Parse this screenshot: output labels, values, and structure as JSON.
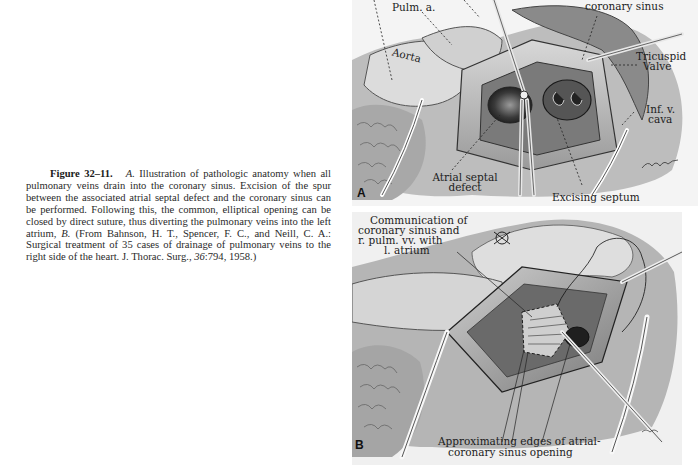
{
  "caption": {
    "figure_label": "Figure 32–11.",
    "panel_a_ref": "A.",
    "text_1": "Illustration of pathologic anatomy when all pulmonary veins drain into the coronary sinus. Excision of the spur between the associated atrial septal defect and the coronary sinus can be performed. Following this, the common, elliptical opening can be closed by direct suture, thus diverting the pulmonary veins into the left atrium,",
    "panel_b_ref": "B.",
    "text_2": "(From Bahnson, H. T., Spencer, F. C., and Neill, C. A.: Surgical treatment of 35 cases of drainage of pulmonary veins to the right side of the heart. J. Thorac. Surg.,",
    "volume": "36",
    "pages": ":794, 1958.)"
  },
  "panel_a": {
    "letter": "A",
    "labels": {
      "pulm_a": "Pulm. a.",
      "coronary_sinus": "coronary sinus",
      "aorta": "Aorta",
      "tricuspid_1": "Tricuspid",
      "tricuspid_2": "Valve",
      "ivc_1": "Inf. v.",
      "ivc_2": "cava",
      "asd_1": "Atrial septal",
      "asd_2": "defect",
      "excising": "Excising septum"
    }
  },
  "panel_b": {
    "letter": "B",
    "labels": {
      "comm_1": "Communication of",
      "comm_2": "coronary sinus and",
      "comm_3": "r. pulm. vv. with",
      "comm_4": "l. atrium",
      "approx_1": "Approximating edges of atrial-",
      "approx_2": "coronary sinus opening"
    }
  }
}
